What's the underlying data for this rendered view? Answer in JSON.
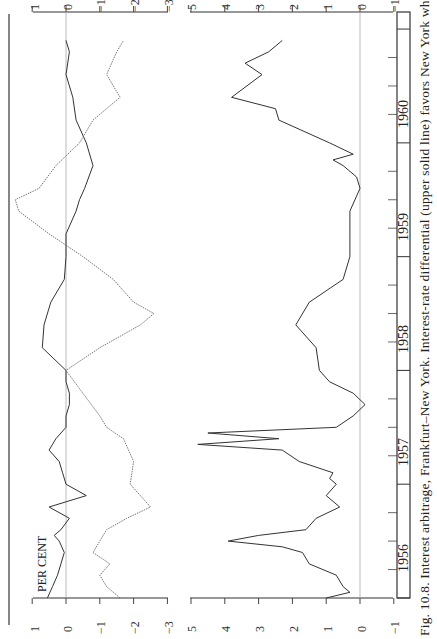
{
  "figure": {
    "caption": "Fig. 10.8. Interest arbitrage, Frankfurt–New York. Interest-rate differential (upper solid line) favors New York when positive.",
    "ylabel": "PER CENT",
    "orientation": "rotated 90° counter-clockwise (time runs bottom to top)"
  },
  "axes": {
    "upper_ticks": [
      "1",
      "0",
      "−1",
      "−2",
      "−3"
    ],
    "lower_ticks": [
      "5",
      "4",
      "3",
      "2",
      "1",
      "0",
      "−1"
    ],
    "years": [
      "1956",
      "1957",
      "1958",
      "1959",
      "1960"
    ]
  },
  "chart_data": [
    {
      "type": "line",
      "title": "Interest arbitrage, Frankfurt–New York (upper panel)",
      "xlabel": "",
      "ylabel": "PER CENT",
      "ylim": [
        -3,
        1
      ],
      "x": [
        "1956",
        "1957",
        "1958",
        "1959",
        "1960"
      ],
      "grid": false,
      "zero_line": true,
      "series": [
        {
          "name": "Interest-rate differential (solid)",
          "style": "solid",
          "t": [
            1956.0,
            1956.1,
            1956.2,
            1956.3,
            1956.4,
            1956.5,
            1956.55,
            1956.6,
            1956.7,
            1956.8,
            1956.9,
            1957.0,
            1957.1,
            1957.2,
            1957.3,
            1957.4,
            1957.5,
            1957.6,
            1957.7,
            1957.8,
            1957.9,
            1958.0,
            1958.2,
            1958.4,
            1958.6,
            1958.8,
            1959.0,
            1959.2,
            1959.4,
            1959.5,
            1959.6,
            1959.8,
            1960.0,
            1960.2,
            1960.4,
            1960.6,
            1960.8,
            1960.9
          ],
          "values": [
            0.55,
            0.4,
            0.25,
            0.15,
            0.05,
            0.2,
            0.35,
            0.15,
            -0.1,
            0.5,
            -0.6,
            0.0,
            0.1,
            0.2,
            0.5,
            0.3,
            0.0,
            0.0,
            -0.1,
            -0.1,
            0.0,
            0.0,
            0.7,
            0.65,
            0.45,
            0.05,
            0.0,
            0.0,
            -0.3,
            -0.4,
            -0.55,
            -0.8,
            -0.6,
            -0.3,
            -0.2,
            0.0,
            -0.1,
            0.0
          ]
        },
        {
          "name": "Forward rate / swap (dotted)",
          "style": "dotted",
          "t": [
            1956.0,
            1956.1,
            1956.2,
            1956.3,
            1956.4,
            1956.5,
            1956.6,
            1956.7,
            1956.8,
            1956.9,
            1957.0,
            1957.2,
            1957.4,
            1957.5,
            1957.6,
            1957.8,
            1958.0,
            1958.2,
            1958.4,
            1958.5,
            1958.6,
            1958.8,
            1959.0,
            1959.2,
            1959.4,
            1959.5,
            1959.6,
            1959.8,
            1960.0,
            1960.2,
            1960.4,
            1960.6,
            1960.8,
            1960.9
          ],
          "values": [
            -1.6,
            -1.2,
            -1.0,
            -1.3,
            -0.8,
            -1.0,
            -1.2,
            -1.8,
            -2.5,
            -2.2,
            -1.9,
            -2.0,
            -1.7,
            -1.2,
            -1.0,
            -0.5,
            0.0,
            -1.0,
            -2.2,
            -2.6,
            -2.0,
            -1.4,
            -0.5,
            0.5,
            1.4,
            1.5,
            0.8,
            0.3,
            -0.4,
            -0.8,
            -1.6,
            -1.2,
            -1.5,
            -1.7
          ]
        }
      ]
    },
    {
      "type": "line",
      "title": "Interest arbitrage, Frankfurt–New York (lower panel)",
      "xlabel": "",
      "ylabel": "PER CENT",
      "ylim": [
        -1,
        5
      ],
      "x": [
        "1956",
        "1957",
        "1958",
        "1959",
        "1960"
      ],
      "grid": false,
      "zero_line": true,
      "series": [
        {
          "name": "Net incentive (solid)",
          "style": "solid",
          "t": [
            1956.0,
            1956.05,
            1956.1,
            1956.2,
            1956.3,
            1956.4,
            1956.45,
            1956.5,
            1956.55,
            1956.6,
            1956.7,
            1956.8,
            1956.9,
            1957.0,
            1957.05,
            1957.1,
            1957.2,
            1957.3,
            1957.35,
            1957.4,
            1957.45,
            1957.5,
            1957.6,
            1957.7,
            1957.8,
            1957.9,
            1958.0,
            1958.2,
            1958.4,
            1958.6,
            1958.8,
            1959.0,
            1959.2,
            1959.4,
            1959.6,
            1959.7,
            1959.8,
            1959.85,
            1959.9,
            1960.0,
            1960.2,
            1960.3,
            1960.4,
            1960.6,
            1960.7,
            1960.8,
            1960.9
          ],
          "values": [
            1.0,
            0.3,
            0.5,
            0.7,
            1.5,
            1.7,
            2.3,
            3.9,
            3.0,
            1.6,
            1.3,
            0.6,
            1.0,
            0.7,
            0.9,
            0.8,
            1.8,
            2.3,
            4.8,
            2.4,
            4.5,
            0.7,
            0.2,
            -0.15,
            0.2,
            0.9,
            1.2,
            1.3,
            1.9,
            1.5,
            0.5,
            0.3,
            0.3,
            0.3,
            0.0,
            0.1,
            0.5,
            0.8,
            0.2,
            0.9,
            2.4,
            2.5,
            3.8,
            2.9,
            3.4,
            2.7,
            2.3
          ]
        }
      ]
    }
  ]
}
